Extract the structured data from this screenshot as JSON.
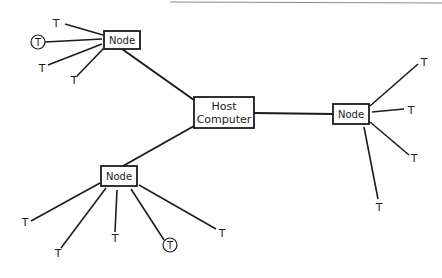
{
  "diagram": {
    "title": "",
    "colors": {
      "ink": "#1c1c1c",
      "background": "#ffffff"
    },
    "host": {
      "id": "host",
      "label_line1": "Host",
      "label_line2": "Computer"
    },
    "nodes": [
      {
        "id": "node-top-left",
        "label": "Node"
      },
      {
        "id": "node-right",
        "label": "Node"
      },
      {
        "id": "node-bottom-left",
        "label": "Node"
      }
    ],
    "terminals": {
      "node-top-left": [
        {
          "label": "T",
          "circled": false
        },
        {
          "label": "T",
          "circled": true
        },
        {
          "label": "T",
          "circled": false
        },
        {
          "label": "T",
          "circled": false
        }
      ],
      "node-right": [
        {
          "label": "T",
          "circled": false
        },
        {
          "label": "T",
          "circled": false
        },
        {
          "label": "T",
          "circled": false
        },
        {
          "label": "T",
          "circled": false
        }
      ],
      "node-bottom-left": [
        {
          "label": "T",
          "circled": false
        },
        {
          "label": "T",
          "circled": false
        },
        {
          "label": "T",
          "circled": false
        },
        {
          "label": "T",
          "circled": true
        },
        {
          "label": "T",
          "circled": false
        }
      ]
    },
    "edges": [
      {
        "from": "host",
        "to": "node-top-left"
      },
      {
        "from": "host",
        "to": "node-right"
      },
      {
        "from": "host",
        "to": "node-bottom-left"
      }
    ]
  }
}
